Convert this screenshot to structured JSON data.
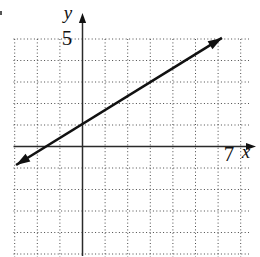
{
  "colors": {
    "background": "#ffffff",
    "ink": "#111111",
    "axis": "#2a2a2a",
    "grid_dots": "#4a4a4a"
  },
  "chart_data": {
    "type": "line",
    "title": "",
    "xlabel": "x",
    "ylabel": "y",
    "x_ticks": [
      {
        "value": 7,
        "label": "7"
      }
    ],
    "y_ticks": [
      {
        "value": 5,
        "label": "5"
      }
    ],
    "xlim": [
      -3.2,
      7.8
    ],
    "ylim": [
      -5.2,
      5.5
    ],
    "grid": {
      "style": "dotted",
      "x_lines": [
        -3,
        -2,
        -1,
        1,
        2,
        3,
        4,
        5,
        6,
        7
      ],
      "y_lines": [
        -5,
        -4,
        -3,
        -2,
        -1,
        1,
        2,
        3,
        4,
        5
      ]
    },
    "axes": {
      "x_axis_arrow": "right",
      "y_axis_arrow": "up"
    },
    "series": [
      {
        "name": "graphed-line",
        "type": "line",
        "arrows": "both",
        "endpoints": [
          [
            -2.94,
            -0.86
          ],
          [
            6.17,
            5.05
          ]
        ],
        "slope": 0.6,
        "y_intercept": 1,
        "x_intercept": -1.7,
        "points_on_line": [
          [
            0,
            1
          ],
          [
            5,
            4
          ]
        ]
      }
    ],
    "legend": null
  }
}
